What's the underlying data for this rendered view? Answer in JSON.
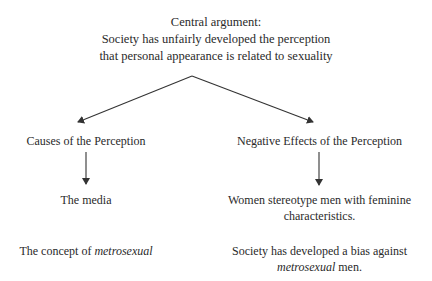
{
  "central": {
    "heading": "Central argument:",
    "line1": "Society has unfairly developed the perception",
    "line2": "that personal appearance is related to sexuality"
  },
  "left_branch": {
    "title": "Causes of the Perception",
    "item1": "The media",
    "item2_prefix": "The concept of ",
    "item2_italic": "metrosexual"
  },
  "right_branch": {
    "title": "Negative Effects of the Perception",
    "item1_line1": "Women stereotype men with feminine",
    "item1_line2": "characteristics.",
    "item2_line1": "Society has developed a bias against",
    "item2_italic": "metrosexual",
    "item2_suffix": " men."
  },
  "colors": {
    "line": "#333333",
    "text": "#2a2a2a"
  }
}
